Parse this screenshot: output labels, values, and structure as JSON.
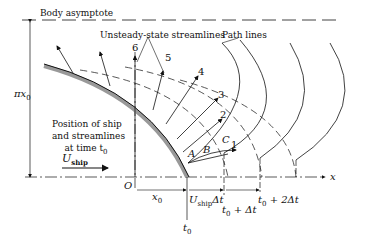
{
  "labels": {
    "body_asymptote": "Body asymptote",
    "unsteady_streamlines": "Unsteady-state streamlines",
    "path_lines": "Path lines",
    "pi_x0": "πx",
    "pi_x0_sub": "0",
    "position_line1": "Position of ship",
    "position_line2": "and streamlines",
    "position_line3": "at time t",
    "position_line3_sub": "0",
    "u_ship": "U",
    "u_ship_sub": "ship",
    "origin": "O",
    "x0": "x",
    "x0_sub": "0",
    "x_axis": "x",
    "u_ship_dt": "U",
    "u_ship_dt_sub": "ship",
    "u_ship_dt_tail": "Δt",
    "t0": "t",
    "t0_sub": "0",
    "t0_dt": "t",
    "t0_dt_sub": "0",
    "t0_dt_tail": " + Δt",
    "t0_2dt": "t",
    "t0_2dt_sub": "0",
    "t0_2dt_tail": " + 2Δt",
    "streamline_numbers": [
      "1",
      "2",
      "3",
      "4",
      "5",
      "6"
    ],
    "points": [
      "A",
      "B",
      "C"
    ]
  }
}
